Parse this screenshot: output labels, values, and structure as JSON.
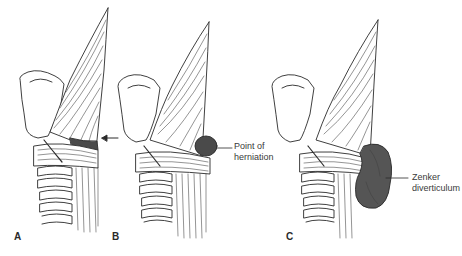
{
  "figure": {
    "panels": [
      {
        "id": "A",
        "letter": "A",
        "annotation": "arrow pointing to weak area between muscles",
        "label": ""
      },
      {
        "id": "B",
        "letter": "B",
        "label": "Point of herniation",
        "label_lines": [
          "Point of",
          "herniation"
        ]
      },
      {
        "id": "C",
        "letter": "C",
        "label": "Zenker diverticulum",
        "label_lines": [
          "Zenker",
          "diverticulum"
        ]
      }
    ],
    "colors": {
      "ink": "#2a2a2a",
      "pouch": "#555555",
      "pouch_dark": "#3e3e3e",
      "background": "#ffffff"
    }
  }
}
